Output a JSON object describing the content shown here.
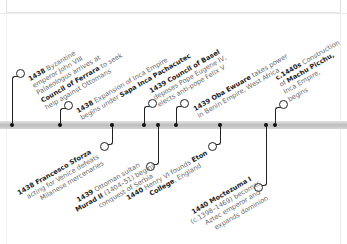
{
  "timeline": {
    "events": [
      {
        "pos": "above",
        "year": "1438",
        "lines": [
          "Byzantine",
          "emperor John VIII",
          "Palaeologus arrives at"
        ],
        "bold_line": "Council of Ferrara",
        "bold_suffix": " to seek",
        "extra": "help against Ottomans"
      },
      {
        "pos": "above",
        "year": "1438",
        "lines": [
          "Expansion of Inca Empire"
        ],
        "pre": "begins under ",
        "bold": "Sapa Inca Pachacutec"
      },
      {
        "pos": "above",
        "year": "1439",
        "bold": "Council of Basel",
        "lines": [
          "deposes Pope Eugene IV,",
          "elects anti-pope Felix V"
        ]
      },
      {
        "pos": "above",
        "year": "1439",
        "bold": "Oba Ewuare",
        "after": " takes power",
        "lines": [
          "in Benin Empire, West Africa"
        ]
      },
      {
        "pos": "above",
        "year": "c.1440s",
        "after": " Construction",
        "pre": "of ",
        "bold": "Machu Picchu,",
        "lines": [
          "Inca Empire,",
          "begins"
        ]
      },
      {
        "pos": "below",
        "year": "1438",
        "bold": "Francesco Sforza",
        "lines": [
          "acting for Venice defeats",
          "Milanese mercenaries"
        ]
      },
      {
        "pos": "below",
        "year": "1439",
        "after": " Ottoman sultan",
        "bold": "Murad II",
        "rest": " (1404–51) begins",
        "lines": [
          "conquest of Serbia"
        ]
      },
      {
        "pos": "below",
        "year": "1440",
        "after": " Henry VI founds ",
        "bold": "Eton",
        "bold2": "College",
        ", ": "",
        "tail": ", England"
      },
      {
        "pos": "below",
        "year": "1440",
        "bold": "Moctezuma I",
        "lines": [
          "(c.1398–1469) becomes",
          "Aztec emperor and",
          "expands dominion"
        ]
      }
    ]
  },
  "text": {
    "e1": {
      "year": "1438",
      "l1": " Byzantine",
      "l2": "emperor John VIII",
      "l3": "Palaeologus arrives at",
      "l4b": "Council of Ferrara",
      "l4": " to seek",
      "l5": "help against Ottomans"
    },
    "e2": {
      "year": "1438",
      "l1": " Expansion of Inca Empire",
      "l2": "begins under ",
      "l2b": "Sapa Inca Pachacutec"
    },
    "e3": {
      "year": "1439",
      "l1b": " Council of Basel",
      "l2": "deposes Pope Eugene IV,",
      "l3": "elects anti-pope Felix V"
    },
    "e4": {
      "year": "1439",
      "l1b": " Oba Ewuare",
      "l1": " takes power",
      "l2": "in Benin Empire, West Africa"
    },
    "e5": {
      "year": "c.1440s",
      "l1": " Construction",
      "l2": "of ",
      "l2b": "Machu Picchu,",
      "l3": "Inca Empire,",
      "l4": "begins"
    },
    "e6": {
      "year": "1438",
      "l1b": " Francesco Sforza",
      "l2": "acting for Venice defeats",
      "l3": "Milanese mercenaries"
    },
    "e7": {
      "year": "1439",
      "l1": " Ottoman sultan",
      "l2b": "Murad II",
      "l2": " (1404–51) begins",
      "l3": "conquest of Serbia"
    },
    "e8": {
      "year": "1440",
      "l1": " Henry VI founds ",
      "l1b": "Eton",
      "l2b": "College",
      "l2": ", England"
    },
    "e9": {
      "year": "1440",
      "l1b": " Moctezuma I",
      "l2": "(c.1398–1469) becomes",
      "l3": "Aztec emperor and",
      "l4": "expands dominion"
    }
  }
}
